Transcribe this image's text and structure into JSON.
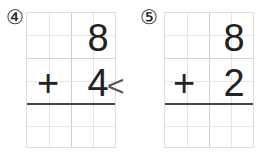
{
  "problems": [
    {
      "number": "④",
      "top_digit": "8",
      "operator": "+",
      "bottom_digit": "4",
      "answer": "",
      "pointer": "<"
    },
    {
      "number": "⑤",
      "top_digit": "8",
      "operator": "+",
      "bottom_digit": "2",
      "answer": ""
    }
  ],
  "colors": {
    "grid_line": "#e4e4e4",
    "answer_rule": "#444444",
    "text": "#222222"
  }
}
